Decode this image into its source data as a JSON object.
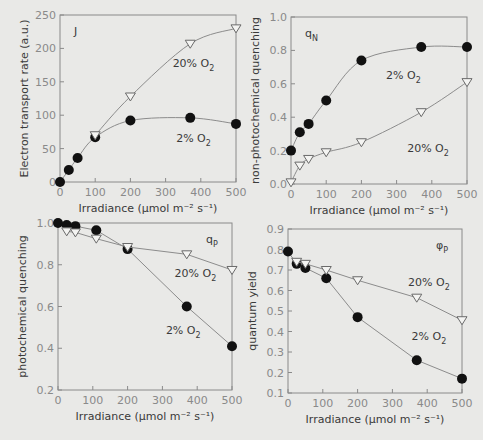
{
  "chart_data": [
    {
      "type": "line",
      "panel_label": "J",
      "xlabel": "Irradiance (µmol m⁻² s⁻¹)",
      "ylabel": "Electron transport rate (a.u.)",
      "xlim": [
        0,
        500
      ],
      "ylim": [
        0,
        250
      ],
      "xticks": [
        0,
        100,
        200,
        300,
        400,
        500
      ],
      "yticks": [
        0,
        50,
        100,
        150,
        200,
        250
      ],
      "grid": false,
      "frame": {
        "x0": 60,
        "x1": 236,
        "y0": 182,
        "y1": 15
      },
      "series": [
        {
          "name": "2% O2",
          "marker": "filled-circle",
          "smooth": true,
          "x": [
            0,
            25,
            50,
            100,
            200,
            370,
            500
          ],
          "y": [
            0,
            18,
            36,
            67,
            92,
            96,
            87
          ]
        },
        {
          "name": "20% O2",
          "marker": "open-triangle-down",
          "smooth": true,
          "x": [
            100,
            200,
            370,
            500
          ],
          "y": [
            70,
            128,
            207,
            230
          ]
        }
      ],
      "annotations": [
        {
          "text": "20% O",
          "sub": "2",
          "x": 320,
          "y": 172
        },
        {
          "text": "2% O",
          "sub": "2",
          "x": 330,
          "y": 60
        }
      ]
    },
    {
      "type": "line",
      "panel_label": "q",
      "panel_label_sub": "N",
      "xlabel": "Irradiance (µmol m⁻² s⁻¹)",
      "ylabel": "non-photochemical quenching",
      "xlim": [
        0,
        500
      ],
      "ylim": [
        0.0,
        1.0
      ],
      "xticks": [
        0,
        100,
        200,
        300,
        400,
        500
      ],
      "yticks": [
        "0.0",
        "0.2",
        "0.4",
        "0.6",
        "0.8",
        "1.0"
      ],
      "grid": false,
      "frame": {
        "x0": 291,
        "x1": 467,
        "y0": 184,
        "y1": 17
      },
      "series": [
        {
          "name": "2% O2",
          "marker": "filled-circle",
          "smooth": true,
          "x": [
            0,
            25,
            50,
            100,
            200,
            370,
            500
          ],
          "y": [
            0.2,
            0.31,
            0.36,
            0.5,
            0.74,
            0.82,
            0.82
          ]
        },
        {
          "name": "20% O2",
          "marker": "open-triangle-down",
          "smooth": true,
          "x": [
            0,
            25,
            50,
            100,
            200,
            370,
            500
          ],
          "y": [
            0.01,
            0.11,
            0.15,
            0.19,
            0.25,
            0.43,
            0.61
          ]
        }
      ],
      "annotations": [
        {
          "text": "2% O",
          "sub": "2",
          "x": 270,
          "y": 0.63
        },
        {
          "text": "20% O",
          "sub": "2",
          "x": 330,
          "y": 0.19
        }
      ]
    },
    {
      "type": "line",
      "panel_label": "q",
      "panel_label_sub": "P",
      "xlabel": "Irradiance (µmol m⁻² s⁻¹)",
      "ylabel": "photochemical quenching",
      "xlim": [
        0,
        500
      ],
      "ylim": [
        0.2,
        1.0
      ],
      "xticks": [
        0,
        100,
        200,
        300,
        400,
        500
      ],
      "yticks": [
        "0.2",
        "0.4",
        "0.6",
        "0.8",
        "1.0"
      ],
      "grid": false,
      "frame": {
        "x0": 58,
        "x1": 232,
        "y0": 390,
        "y1": 223
      },
      "series": [
        {
          "name": "2% O2",
          "marker": "filled-circle",
          "smooth": false,
          "x": [
            0,
            25,
            50,
            110,
            200,
            370,
            500
          ],
          "y": [
            1.0,
            0.99,
            0.985,
            0.965,
            0.875,
            0.6,
            0.41
          ]
        },
        {
          "name": "20% O2",
          "marker": "open-triangle-down",
          "smooth": false,
          "x": [
            25,
            50,
            110,
            200,
            370,
            500
          ],
          "y": [
            0.96,
            0.955,
            0.925,
            0.885,
            0.85,
            0.775
          ]
        }
      ],
      "annotations": [
        {
          "text": "20% O",
          "sub": "2",
          "x": 335,
          "y": 0.74
        },
        {
          "text": "2% O",
          "sub": "2",
          "x": 310,
          "y": 0.47
        }
      ]
    },
    {
      "type": "line",
      "panel_label": "φ",
      "panel_label_sub": "P",
      "xlabel": "Irradiance (µmol m⁻² s⁻¹)",
      "ylabel": "quantum yield",
      "xlim": [
        0,
        500
      ],
      "ylim": [
        0.1,
        0.9
      ],
      "xticks": [
        0,
        100,
        200,
        300,
        400,
        500
      ],
      "yticks": [
        "0.1",
        "0.2",
        "0.3",
        "0.4",
        "0.5",
        "0.6",
        "0.7",
        "0.8",
        "0.9"
      ],
      "grid": false,
      "frame": {
        "x0": 288,
        "x1": 462,
        "y0": 393,
        "y1": 229
      },
      "series": [
        {
          "name": "2% O2",
          "marker": "filled-circle",
          "smooth": false,
          "x": [
            0,
            25,
            50,
            110,
            200,
            370,
            500
          ],
          "y": [
            0.79,
            0.73,
            0.71,
            0.66,
            0.47,
            0.26,
            0.17
          ]
        },
        {
          "name": "20% O2",
          "marker": "open-triangle-down",
          "smooth": false,
          "x": [
            25,
            50,
            110,
            200,
            370,
            500
          ],
          "y": [
            0.74,
            0.73,
            0.7,
            0.65,
            0.565,
            0.455
          ]
        }
      ],
      "annotations": [
        {
          "text": "20% O",
          "sub": "2",
          "x": 345,
          "y": 0.62
        },
        {
          "text": "2% O",
          "sub": "2",
          "x": 355,
          "y": 0.36
        }
      ]
    }
  ]
}
